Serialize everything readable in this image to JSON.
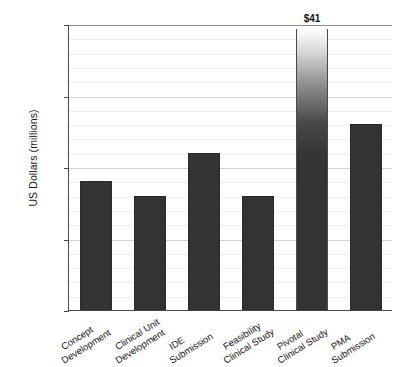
{
  "chart_data": {
    "type": "bar",
    "title": "",
    "xlabel": "",
    "ylabel": "US Dollars (millions)",
    "ylim": [
      0,
      20
    ],
    "grid": true,
    "legend": "none",
    "y_ticks": [
      "$0",
      "$5",
      "$10",
      "$15",
      "+$20"
    ],
    "y_tick_values": [
      0,
      5,
      10,
      15,
      20
    ],
    "minor_gridline_step": 1,
    "axis_note": "Top tick reads +$20; the Pivotal Clinical Study bar exceeds the axis and is truncated with a faded top, labelled $41.",
    "categories": [
      "Concept Development",
      "Clinical Unit Development",
      "IDE Submission",
      "Feasibility Clinical Study",
      "Pivotal Clinical Study",
      "PMA Submission"
    ],
    "category_lines": [
      [
        "Concept",
        "Development"
      ],
      [
        "Clinical Unit",
        "Development"
      ],
      [
        "IDE",
        "Submission"
      ],
      [
        "Feasibility",
        "Clinical Study"
      ],
      [
        "Pivotal",
        "Clinical Study"
      ],
      [
        "PMA",
        "Submission"
      ]
    ],
    "values": [
      9,
      8,
      11,
      8,
      41,
      13
    ],
    "value_labels": [
      "",
      "",
      "",
      "",
      "$41",
      ""
    ],
    "truncated": [
      false,
      false,
      false,
      false,
      true,
      false
    ],
    "bar_color": "#333333",
    "gridline_color": "#d4d4d4",
    "minor_gridline_color": "#f0f0f0",
    "axis_color": "#4a4a4a",
    "background_color": "#ffffff"
  }
}
